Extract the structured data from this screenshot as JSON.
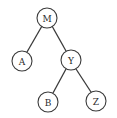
{
  "diagram": {
    "type": "binary-tree",
    "nodes": [
      {
        "id": "M",
        "label": "M",
        "cx": 47,
        "cy": 18
      },
      {
        "id": "A",
        "label": "A",
        "cx": 22,
        "cy": 61
      },
      {
        "id": "Y",
        "label": "Y",
        "cx": 71,
        "cy": 60
      },
      {
        "id": "B",
        "label": "B",
        "cx": 48,
        "cy": 102
      },
      {
        "id": "Z",
        "label": "Z",
        "cx": 96,
        "cy": 101
      }
    ],
    "edges": [
      {
        "from": "M",
        "to": "A"
      },
      {
        "from": "M",
        "to": "Y"
      },
      {
        "from": "Y",
        "to": "B"
      },
      {
        "from": "Y",
        "to": "Z"
      }
    ],
    "node_radius": 10,
    "colors": {
      "stroke": "#3a3a3a",
      "fill": "#ffffff",
      "text": "#2a2a2a"
    }
  }
}
